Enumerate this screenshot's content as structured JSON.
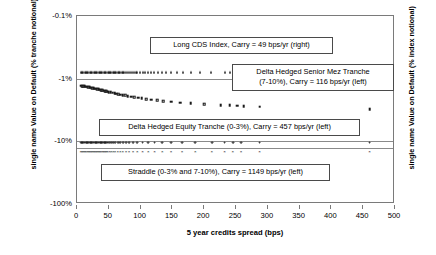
{
  "chart_data": {
    "type": "scatter",
    "title": "",
    "xlabel": "5 year credits spread (bps)",
    "ylabel_left": "single name Value on Default (% tranche notional)",
    "ylabel_right": "single name Value on Default (% index notional)",
    "xlim": [
      0,
      500
    ],
    "xticks": [
      0,
      50,
      100,
      150,
      200,
      250,
      300,
      350,
      400,
      450,
      500
    ],
    "xticklabels": [
      "0",
      "50",
      "100",
      "150",
      "200",
      "250",
      "300",
      "350",
      "400",
      "450",
      "500"
    ],
    "yscale": "log-negative",
    "yticks": [
      -0.1,
      -1,
      -10,
      -100
    ],
    "yticklabels": [
      "-0.1%",
      "-1%",
      "-10%",
      "-100%"
    ],
    "grid": false,
    "legend_position": "inline-annotations",
    "series": [
      {
        "name": "Long CDS Index",
        "marker": "triangle",
        "annotation": "Long CDS Index, Carry = 49 bps/yr (right)",
        "axis": "right",
        "carry_bps_per_yr": 49,
        "points": [
          [
            6,
            -0.79
          ],
          [
            8,
            -0.79
          ],
          [
            10,
            -0.79
          ],
          [
            12,
            -0.79
          ],
          [
            14,
            -0.79
          ],
          [
            16,
            -0.79
          ],
          [
            18,
            -0.79
          ],
          [
            20,
            -0.79
          ],
          [
            22,
            -0.79
          ],
          [
            24,
            -0.79
          ],
          [
            26,
            -0.79
          ],
          [
            28,
            -0.79
          ],
          [
            30,
            -0.79
          ],
          [
            32,
            -0.79
          ],
          [
            34,
            -0.79
          ],
          [
            36,
            -0.79
          ],
          [
            38,
            -0.79
          ],
          [
            40,
            -0.79
          ],
          [
            42,
            -0.79
          ],
          [
            44,
            -0.79
          ],
          [
            46,
            -0.79
          ],
          [
            48,
            -0.79
          ],
          [
            50,
            -0.79
          ],
          [
            52,
            -0.79
          ],
          [
            54,
            -0.79
          ],
          [
            56,
            -0.79
          ],
          [
            58,
            -0.79
          ],
          [
            60,
            -0.79
          ],
          [
            62,
            -0.79
          ],
          [
            64,
            -0.79
          ],
          [
            66,
            -0.79
          ],
          [
            68,
            -0.79
          ],
          [
            70,
            -0.79
          ],
          [
            72,
            -0.79
          ],
          [
            74,
            -0.79
          ],
          [
            77,
            -0.79
          ],
          [
            80,
            -0.79
          ],
          [
            83,
            -0.79
          ],
          [
            86,
            -0.79
          ],
          [
            89,
            -0.79
          ],
          [
            92,
            -0.79
          ],
          [
            95,
            -0.79
          ],
          [
            99,
            -0.79
          ],
          [
            103,
            -0.79
          ],
          [
            107,
            -0.79
          ],
          [
            111,
            -0.79
          ],
          [
            116,
            -0.79
          ],
          [
            121,
            -0.79
          ],
          [
            127,
            -0.79
          ],
          [
            133,
            -0.79
          ],
          [
            140,
            -0.79
          ],
          [
            148,
            -0.79
          ],
          [
            157,
            -0.79
          ],
          [
            167,
            -0.79
          ],
          [
            179,
            -0.79
          ],
          [
            193,
            -0.79
          ],
          [
            210,
            -0.79
          ],
          [
            232,
            -0.79
          ],
          [
            240,
            -0.79
          ],
          [
            248,
            -0.79
          ],
          [
            256,
            -0.79
          ],
          [
            287,
            -0.79
          ],
          [
            460,
            -0.79
          ]
        ]
      },
      {
        "name": "Delta Hedged Senior Mez Tranche (7-10%)",
        "marker": "square",
        "annotation": "Delta Hedged Senior Mez Tranche (7-10%), Carry = 116 bps/yr (left)",
        "axis": "left",
        "tranche": "7-10%",
        "carry_bps_per_yr": 116,
        "points": [
          [
            6,
            -1.3
          ],
          [
            8,
            -1.31
          ],
          [
            10,
            -1.32
          ],
          [
            12,
            -1.33
          ],
          [
            14,
            -1.34
          ],
          [
            16,
            -1.35
          ],
          [
            18,
            -1.37
          ],
          [
            20,
            -1.38
          ],
          [
            22,
            -1.39
          ],
          [
            24,
            -1.41
          ],
          [
            26,
            -1.42
          ],
          [
            28,
            -1.44
          ],
          [
            30,
            -1.45
          ],
          [
            32,
            -1.47
          ],
          [
            34,
            -1.48
          ],
          [
            36,
            -1.5
          ],
          [
            38,
            -1.52
          ],
          [
            40,
            -1.53
          ],
          [
            42,
            -1.55
          ],
          [
            44,
            -1.57
          ],
          [
            46,
            -1.59
          ],
          [
            48,
            -1.61
          ],
          [
            50,
            -1.63
          ],
          [
            53,
            -1.65
          ],
          [
            56,
            -1.68
          ],
          [
            59,
            -1.7
          ],
          [
            62,
            -1.73
          ],
          [
            65,
            -1.76
          ],
          [
            68,
            -1.79
          ],
          [
            72,
            -1.82
          ],
          [
            76,
            -1.85
          ],
          [
            80,
            -1.89
          ],
          [
            85,
            -1.93
          ],
          [
            90,
            -1.97
          ],
          [
            96,
            -2.01
          ],
          [
            102,
            -2.06
          ],
          [
            109,
            -2.11
          ],
          [
            117,
            -2.16
          ],
          [
            126,
            -2.22
          ],
          [
            136,
            -2.28
          ],
          [
            148,
            -2.34
          ],
          [
            162,
            -2.41
          ],
          [
            179,
            -2.48
          ],
          [
            200,
            -2.56
          ],
          [
            226,
            -2.63
          ],
          [
            240,
            -2.68
          ],
          [
            252,
            -2.71
          ],
          [
            262,
            -2.74
          ],
          [
            287,
            -2.8
          ],
          [
            460,
            -3.05
          ]
        ]
      },
      {
        "name": "Delta Hedged Equity Tranche (0-3%)",
        "marker": "circle",
        "annotation": "Delta Hedged Equity Tranche (0-3%), Carry = 457 bps/yr (left)",
        "axis": "left",
        "tranche": "0-3%",
        "carry_bps_per_yr": 457,
        "points": [
          [
            6,
            -10.5
          ],
          [
            8,
            -10.5
          ],
          [
            10,
            -10.5
          ],
          [
            12,
            -10.5
          ],
          [
            14,
            -10.5
          ],
          [
            16,
            -10.5
          ],
          [
            18,
            -10.5
          ],
          [
            20,
            -10.5
          ],
          [
            22,
            -10.5
          ],
          [
            24,
            -10.5
          ],
          [
            26,
            -10.5
          ],
          [
            28,
            -10.5
          ],
          [
            30,
            -10.5
          ],
          [
            32,
            -10.5
          ],
          [
            34,
            -10.5
          ],
          [
            36,
            -10.5
          ],
          [
            38,
            -10.5
          ],
          [
            40,
            -10.5
          ],
          [
            42,
            -10.5
          ],
          [
            44,
            -10.5
          ],
          [
            46,
            -10.5
          ],
          [
            48,
            -10.5
          ],
          [
            51,
            -10.5
          ],
          [
            54,
            -10.5
          ],
          [
            57,
            -10.5
          ],
          [
            60,
            -10.5
          ],
          [
            64,
            -10.5
          ],
          [
            68,
            -10.5
          ],
          [
            72,
            -10.5
          ],
          [
            77,
            -10.5
          ],
          [
            82,
            -10.5
          ],
          [
            88,
            -10.5
          ],
          [
            95,
            -10.5
          ],
          [
            103,
            -10.5
          ],
          [
            112,
            -10.5
          ],
          [
            122,
            -10.5
          ],
          [
            134,
            -10.5
          ],
          [
            148,
            -10.5
          ],
          [
            165,
            -10.5
          ],
          [
            186,
            -10.5
          ],
          [
            212,
            -10.5
          ],
          [
            232,
            -10.5
          ],
          [
            245,
            -10.5
          ],
          [
            258,
            -10.5
          ],
          [
            287,
            -10.5
          ],
          [
            460,
            -10.5
          ]
        ]
      },
      {
        "name": "Straddle (0-3% and 7-10%)",
        "marker": "cross",
        "annotation": "Straddle (0-3% and 7-10%), Carry = 1149 bps/yr (left)",
        "axis": "left",
        "tranche": "0-3% and 7-10%",
        "carry_bps_per_yr": 1149,
        "points": [
          [
            6,
            -14.8
          ],
          [
            8,
            -14.8
          ],
          [
            10,
            -14.8
          ],
          [
            12,
            -14.8
          ],
          [
            14,
            -14.8
          ],
          [
            16,
            -14.8
          ],
          [
            18,
            -14.8
          ],
          [
            20,
            -14.8
          ],
          [
            22,
            -14.8
          ],
          [
            24,
            -14.8
          ],
          [
            26,
            -14.8
          ],
          [
            28,
            -14.8
          ],
          [
            30,
            -14.8
          ],
          [
            32,
            -14.8
          ],
          [
            34,
            -14.8
          ],
          [
            36,
            -14.8
          ],
          [
            38,
            -14.8
          ],
          [
            40,
            -14.8
          ],
          [
            42,
            -14.8
          ],
          [
            44,
            -14.8
          ],
          [
            46,
            -14.8
          ],
          [
            48,
            -14.8
          ],
          [
            51,
            -14.8
          ],
          [
            54,
            -14.8
          ],
          [
            57,
            -14.8
          ],
          [
            60,
            -14.8
          ],
          [
            64,
            -14.8
          ],
          [
            68,
            -14.8
          ],
          [
            72,
            -14.8
          ],
          [
            77,
            -14.8
          ],
          [
            82,
            -14.8
          ],
          [
            88,
            -14.8
          ],
          [
            95,
            -14.8
          ],
          [
            103,
            -14.8
          ],
          [
            112,
            -14.8
          ],
          [
            122,
            -14.8
          ],
          [
            134,
            -14.8
          ],
          [
            148,
            -14.8
          ],
          [
            165,
            -14.8
          ],
          [
            186,
            -14.8
          ],
          [
            212,
            -14.8
          ],
          [
            232,
            -14.8
          ],
          [
            245,
            -14.8
          ],
          [
            258,
            -14.8
          ],
          [
            287,
            -14.8
          ],
          [
            460,
            -14.8
          ]
        ]
      }
    ],
    "separator_lines_y": [
      -1.0,
      -10.0,
      -12.6
    ],
    "annotations": [
      {
        "id": "ann-long-cds",
        "text": "Long CDS Index, Carry = 49 bps/yr (right)",
        "x_px": 150,
        "y_px": 37,
        "w_px": 183
      },
      {
        "id": "ann-senior-mez",
        "line1": "Delta Hedged Senior Mez Tranche",
        "line2": "(7-10%), Carry = 116 bps/yr (left)",
        "x_px": 232,
        "y_px": 64,
        "w_px": 162
      },
      {
        "id": "ann-equity",
        "text": "Delta Hedged Equity Tranche (0-3%), Carry = 457 bps/yr (left)",
        "x_px": 99,
        "y_px": 119,
        "w_px": 261
      },
      {
        "id": "ann-straddle",
        "text": "Straddle (0-3% and 7-10%), Carry = 1149 bps/yr (left)",
        "x_px": 101,
        "y_px": 164,
        "w_px": 229
      }
    ]
  }
}
